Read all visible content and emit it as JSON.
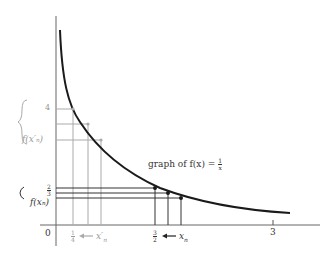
{
  "diagram": {
    "curve_label": {
      "prefix": "graph of f(x) = ",
      "num": "1",
      "den": "x"
    },
    "y_labels": {
      "four": "4",
      "f_xn_prime": "f(x′ₙ)",
      "two_thirds": {
        "num": "2",
        "den": "3"
      },
      "f_xn": "f(xₙ)"
    },
    "x_labels": {
      "zero": "0",
      "quarter": {
        "num": "1",
        "den": "4"
      },
      "xn_prime": "← x′ₙ",
      "three_halves": {
        "num": "3",
        "den": "2"
      },
      "xn": "← xₙ",
      "three": "3"
    },
    "braces": {
      "upper": "{",
      "lower": "{"
    },
    "colors": {
      "curve": "#1a1a1a",
      "axis": "#555555",
      "grid_gray": "#999999",
      "text_dark": "#333333"
    }
  }
}
